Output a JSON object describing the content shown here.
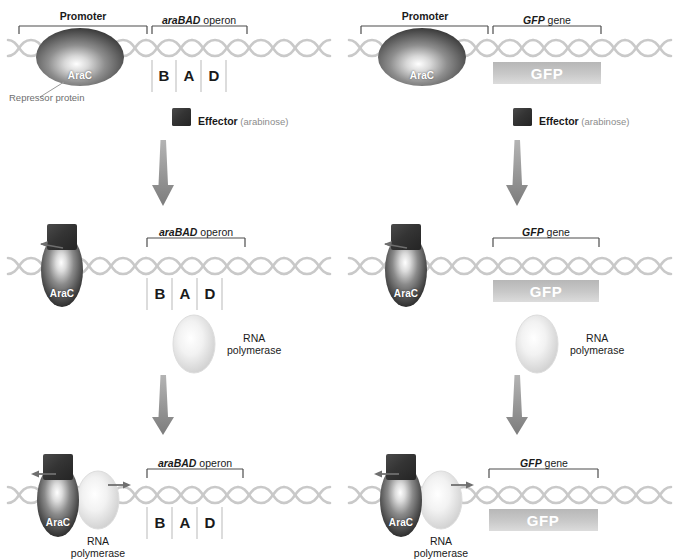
{
  "diagram": {
    "colors": {
      "dna": "#c9c9c9",
      "arac_dark": "#2b2b2b",
      "arac_light": "#ffffff",
      "effector_box": "#3a3a3a",
      "gfp_bar_top": "#bdbdbd",
      "gfp_bar_bottom": "#d6d6d6",
      "arrow": "#8e8e8e",
      "bracket": "#4d4d4d",
      "text": "#1a1a1a",
      "text_muted": "#8c8c8c"
    }
  },
  "columns": [
    {
      "id": "left",
      "gene_label_italic": "araBAD",
      "gene_label_rest": " operon",
      "gene_kind": "operon"
    },
    {
      "id": "right",
      "gene_label_italic": "GFP",
      "gene_label_rest": " gene",
      "gene_kind": "gfp"
    }
  ],
  "left": {
    "row1": {
      "promoter_label": "Promoter",
      "gene_label_italic": "araBAD",
      "gene_label_rest": " operon",
      "protein_name": "AraC",
      "repressor_caption": "Repressor protein",
      "genes": [
        "B",
        "A",
        "D"
      ],
      "effector_label_bold": "Effector",
      "effector_label_rest": " (arabinose)"
    },
    "row2": {
      "gene_label_italic": "araBAD",
      "gene_label_rest": " operon",
      "protein_name": "AraC",
      "genes": [
        "B",
        "A",
        "D"
      ],
      "rnap_line1": "RNA",
      "rnap_line2": "polymerase"
    },
    "row3": {
      "gene_label_italic": "araBAD",
      "gene_label_rest": " operon",
      "protein_name": "AraC",
      "genes": [
        "B",
        "A",
        "D"
      ],
      "rnap_line1": "RNA",
      "rnap_line2": "polymerase"
    }
  },
  "right": {
    "row1": {
      "promoter_label": "Promoter",
      "gene_label_italic": "GFP",
      "gene_label_rest": " gene",
      "protein_name": "AraC",
      "gene_bar_label": "GFP",
      "effector_label_bold": "Effector",
      "effector_label_rest": " (arabinose)"
    },
    "row2": {
      "gene_label_italic": "GFP",
      "gene_label_rest": " gene",
      "protein_name": "AraC",
      "gene_bar_label": "GFP",
      "rnap_line1": "RNA",
      "rnap_line2": "polymerase"
    },
    "row3": {
      "gene_label_italic": "GFP",
      "gene_label_rest": " gene",
      "protein_name": "AraC",
      "gene_bar_label": "GFP",
      "rnap_line1": "RNA",
      "rnap_line2": "polymerase"
    }
  }
}
